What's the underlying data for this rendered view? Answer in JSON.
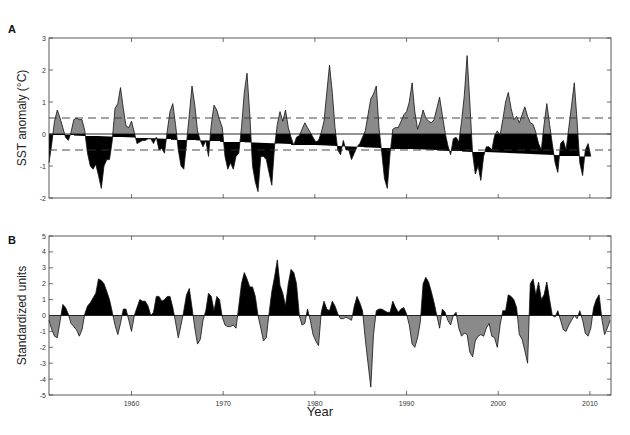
{
  "figure": {
    "panels": [
      "A",
      "B"
    ],
    "xlabel": "Year"
  },
  "colors": {
    "positive_top": "#8a8a8a",
    "negative_top": "#000000",
    "positive_bottom": "#000000",
    "negative_bottom": "#8a8a8a",
    "axis": "#333333",
    "dashed": "#333333"
  },
  "chart_data": [
    {
      "type": "area",
      "panel": "A",
      "title": "",
      "xlabel": "",
      "ylabel": "SST anomaly (°C)",
      "xlim": [
        1951,
        2012.3
      ],
      "ylim": [
        -2,
        3
      ],
      "yticks": [
        -2,
        -1,
        0,
        1,
        2,
        3
      ],
      "xticks": [
        1960,
        1970,
        1980,
        1990,
        2000,
        2010
      ],
      "xtick_labels_shown": false,
      "reference_lines": [
        {
          "y": 0.5,
          "style": "dashed"
        },
        {
          "y": -0.5,
          "style": "dashed"
        },
        {
          "y": 0,
          "style": "solid"
        }
      ],
      "fill_above_zero": "gray",
      "fill_below_zero": "black",
      "x": [
        1951.0,
        1951.3,
        1951.6,
        1951.9,
        1952.2,
        1952.5,
        1952.8,
        1953.1,
        1953.4,
        1953.7,
        1954.0,
        1954.3,
        1954.6,
        1954.9,
        1955.2,
        1955.5,
        1955.8,
        1956.1,
        1956.4,
        1956.7,
        1957.0,
        1957.3,
        1957.6,
        1957.9,
        1958.2,
        1958.5,
        1958.8,
        1959.1,
        1959.4,
        1959.7,
        1960.0,
        1960.3,
        1960.6,
        1960.9,
        1961.2,
        1961.5,
        1961.8,
        1962.1,
        1962.4,
        1962.7,
        1963.0,
        1963.3,
        1963.6,
        1963.9,
        1964.2,
        1964.5,
        1964.8,
        1965.1,
        1965.4,
        1965.7,
        1966.0,
        1966.3,
        1966.6,
        1966.9,
        1967.2,
        1967.5,
        1967.8,
        1968.1,
        1968.4,
        1968.7,
        1969.0,
        1969.3,
        1969.6,
        1969.9,
        1970.2,
        1970.5,
        1970.8,
        1971.1,
        1971.4,
        1971.7,
        1972.0,
        1972.3,
        1972.6,
        1972.9,
        1973.2,
        1973.5,
        1973.8,
        1974.1,
        1974.4,
        1974.7,
        1975.0,
        1975.3,
        1975.6,
        1975.9,
        1976.2,
        1976.5,
        1976.8,
        1977.1,
        1977.4,
        1977.7,
        1978.0,
        1978.3,
        1978.6,
        1978.9,
        1979.2,
        1979.5,
        1979.8,
        1980.1,
        1980.4,
        1980.7,
        1981.0,
        1981.3,
        1981.6,
        1981.9,
        1982.2,
        1982.5,
        1982.8,
        1983.1,
        1983.4,
        1983.7,
        1984.0,
        1984.3,
        1984.6,
        1984.9,
        1985.2,
        1985.5,
        1985.8,
        1986.1,
        1986.4,
        1986.7,
        1987.0,
        1987.3,
        1987.6,
        1987.9,
        1988.2,
        1988.5,
        1988.8,
        1989.1,
        1989.4,
        1989.7,
        1990.0,
        1990.3,
        1990.6,
        1990.9,
        1991.2,
        1991.5,
        1991.8,
        1992.1,
        1992.4,
        1992.7,
        1993.0,
        1993.3,
        1993.6,
        1993.9,
        1994.2,
        1994.5,
        1994.8,
        1995.1,
        1995.4,
        1995.7,
        1996.0,
        1996.3,
        1996.6,
        1996.9,
        1997.2,
        1997.5,
        1997.8,
        1998.1,
        1998.4,
        1998.7,
        1999.0,
        1999.3,
        1999.6,
        1999.9,
        2000.2,
        2000.5,
        2000.8,
        2001.1,
        2001.4,
        2001.7,
        2002.0,
        2002.3,
        2002.6,
        2002.9,
        2003.2,
        2003.5,
        2003.8,
        2004.1,
        2004.4,
        2004.7,
        2005.0,
        2005.3,
        2005.6,
        2005.9,
        2006.2,
        2006.5,
        2006.8,
        2007.1,
        2007.4,
        2007.7,
        2008.0,
        2008.3,
        2008.6,
        2008.9,
        2009.2,
        2009.5,
        2009.8,
        2010.1,
        2010.4,
        2010.7,
        2011.0,
        2011.3,
        2011.6,
        2011.9,
        2012.2
      ],
      "values": [
        -0.9,
        -0.3,
        0.4,
        0.75,
        0.5,
        0.2,
        -0.1,
        -0.2,
        0.05,
        0.45,
        0.5,
        0.45,
        0.45,
        0.1,
        -0.6,
        -1.0,
        -1.1,
        -0.95,
        -1.3,
        -1.7,
        -1.0,
        -0.8,
        -0.8,
        -0.2,
        0.8,
        0.95,
        1.45,
        0.8,
        0.25,
        0.2,
        0.4,
        0.05,
        -0.3,
        -0.25,
        -0.2,
        -0.2,
        -0.15,
        -0.15,
        -0.3,
        -0.1,
        -0.5,
        -0.45,
        -0.6,
        0.1,
        0.7,
        0.95,
        0.3,
        -0.5,
        -1.0,
        -1.1,
        -0.3,
        0.6,
        1.5,
        0.9,
        0.1,
        -0.2,
        -0.4,
        -0.2,
        -0.7,
        0.3,
        0.9,
        0.75,
        0.45,
        0.2,
        -0.7,
        -1.1,
        -0.9,
        -1.1,
        -0.7,
        -0.6,
        0.2,
        1.3,
        1.9,
        0.6,
        -1.0,
        -1.5,
        -1.8,
        -0.7,
        -0.7,
        -0.8,
        -1.2,
        -1.6,
        -0.4,
        0.3,
        0.7,
        0.4,
        0.75,
        0.2,
        -0.1,
        -0.35,
        -0.1,
        -0.05,
        0.15,
        0.35,
        0.2,
        0.05,
        -0.1,
        -0.25,
        -0.2,
        0.05,
        0.4,
        1.3,
        2.15,
        1.3,
        0.2,
        -0.5,
        -0.65,
        -0.2,
        -0.5,
        -0.5,
        -0.8,
        -0.6,
        -0.4,
        -0.3,
        -0.1,
        0.1,
        0.6,
        1.1,
        1.25,
        1.5,
        0.2,
        -0.6,
        -1.4,
        -1.7,
        -0.6,
        0.15,
        0.2,
        0.2,
        0.4,
        0.6,
        0.7,
        1.0,
        1.6,
        0.7,
        0.15,
        0.4,
        0.75,
        0.5,
        0.4,
        0.35,
        0.45,
        0.8,
        1.15,
        0.6,
        0.05,
        -0.35,
        -0.65,
        -0.15,
        -0.1,
        -0.25,
        0.4,
        1.2,
        2.45,
        1.0,
        -0.6,
        -1.25,
        -1.0,
        -1.45,
        -0.7,
        -0.4,
        -0.4,
        -0.5,
        -0.05,
        0.1,
        -0.05,
        0.45,
        1.0,
        1.3,
        0.8,
        0.45,
        0.55,
        0.35,
        0.6,
        0.85,
        0.55,
        0.35,
        0.3,
        0.05,
        -0.3,
        -0.5,
        0.3,
        0.95,
        0.3,
        -0.3,
        -0.9,
        -1.2,
        -0.3,
        -0.2,
        -0.5,
        0.2,
        0.9,
        1.6,
        0.4,
        -0.9,
        -1.3,
        -0.5,
        -0.3,
        -0.7
      ]
    },
    {
      "type": "area",
      "panel": "B",
      "title": "",
      "xlabel": "Year",
      "ylabel": "Standardized units",
      "xlim": [
        1951,
        2012.3
      ],
      "ylim": [
        -5,
        5
      ],
      "yticks": [
        -5,
        -4,
        -3,
        -2,
        -1,
        0,
        1,
        2,
        3,
        4,
        5
      ],
      "xticks": [
        1960,
        1970,
        1980,
        1990,
        2000,
        2010
      ],
      "xtick_labels": [
        "1960",
        "1970",
        "1980",
        "1990",
        "2000",
        "2010"
      ],
      "reference_lines": [
        {
          "y": 0,
          "style": "solid"
        }
      ],
      "fill_above_zero": "black",
      "fill_below_zero": "gray",
      "x": [
        1951.0,
        1951.3,
        1951.6,
        1951.9,
        1952.2,
        1952.5,
        1952.8,
        1953.1,
        1953.4,
        1953.7,
        1954.0,
        1954.3,
        1954.6,
        1954.9,
        1955.2,
        1955.5,
        1955.8,
        1956.1,
        1956.4,
        1956.7,
        1957.0,
        1957.3,
        1957.6,
        1957.9,
        1958.2,
        1958.5,
        1958.8,
        1959.1,
        1959.4,
        1959.7,
        1960.0,
        1960.3,
        1960.6,
        1960.9,
        1961.2,
        1961.5,
        1961.8,
        1962.1,
        1962.4,
        1962.7,
        1963.0,
        1963.3,
        1963.6,
        1963.9,
        1964.2,
        1964.5,
        1964.8,
        1965.1,
        1965.4,
        1965.7,
        1966.0,
        1966.3,
        1966.6,
        1966.9,
        1967.2,
        1967.5,
        1967.8,
        1968.1,
        1968.4,
        1968.7,
        1969.0,
        1969.3,
        1969.6,
        1969.9,
        1970.2,
        1970.5,
        1970.8,
        1971.1,
        1971.4,
        1971.7,
        1972.0,
        1972.3,
        1972.6,
        1972.9,
        1973.2,
        1973.5,
        1973.8,
        1974.1,
        1974.4,
        1974.7,
        1975.0,
        1975.3,
        1975.6,
        1975.9,
        1976.2,
        1976.5,
        1976.8,
        1977.1,
        1977.4,
        1977.7,
        1978.0,
        1978.3,
        1978.6,
        1978.9,
        1979.2,
        1979.5,
        1979.8,
        1980.1,
        1980.4,
        1980.7,
        1981.0,
        1981.3,
        1981.6,
        1981.9,
        1982.2,
        1982.5,
        1982.8,
        1983.1,
        1983.4,
        1983.7,
        1984.0,
        1984.3,
        1984.6,
        1984.9,
        1985.2,
        1985.5,
        1985.8,
        1986.1,
        1986.4,
        1986.7,
        1987.0,
        1987.3,
        1987.6,
        1987.9,
        1988.2,
        1988.5,
        1988.8,
        1989.1,
        1989.4,
        1989.7,
        1990.0,
        1990.3,
        1990.6,
        1990.9,
        1991.2,
        1991.5,
        1991.8,
        1992.1,
        1992.4,
        1992.7,
        1993.0,
        1993.3,
        1993.6,
        1993.9,
        1994.2,
        1994.5,
        1994.8,
        1995.1,
        1995.4,
        1995.7,
        1996.0,
        1996.3,
        1996.6,
        1996.9,
        1997.2,
        1997.5,
        1997.8,
        1998.1,
        1998.4,
        1998.7,
        1999.0,
        1999.3,
        1999.6,
        1999.9,
        2000.2,
        2000.5,
        2000.8,
        2001.1,
        2001.4,
        2001.7,
        2002.0,
        2002.3,
        2002.6,
        2002.9,
        2003.2,
        2003.5,
        2003.8,
        2004.1,
        2004.4,
        2004.7,
        2005.0,
        2005.3,
        2005.6,
        2005.9,
        2006.2,
        2006.5,
        2006.8,
        2007.1,
        2007.4,
        2007.7,
        2008.0,
        2008.3,
        2008.6,
        2008.9,
        2009.2,
        2009.5,
        2009.8,
        2010.1,
        2010.4,
        2010.7,
        2011.0,
        2011.3,
        2011.6,
        2011.9,
        2012.2
      ],
      "values": [
        -0.3,
        -0.9,
        -1.3,
        -1.4,
        -0.4,
        0.7,
        0.5,
        0.1,
        -0.5,
        -0.7,
        -0.9,
        -1.3,
        -0.9,
        0.1,
        0.6,
        0.8,
        1.1,
        1.4,
        2.3,
        2.2,
        2.0,
        1.5,
        1.0,
        0.2,
        -0.6,
        -1.2,
        -0.5,
        0.4,
        0.4,
        -0.3,
        -1.0,
        0.0,
        0.5,
        1.0,
        0.9,
        0.9,
        0.6,
        0.0,
        0.2,
        1.2,
        1.2,
        0.9,
        1.0,
        1.2,
        1.2,
        0.5,
        -0.4,
        -1.4,
        -0.6,
        0.3,
        1.3,
        1.7,
        0.5,
        -0.8,
        -1.8,
        -1.5,
        -0.3,
        0.3,
        1.4,
        1.2,
        0.3,
        1.2,
        1.0,
        -0.1,
        -0.6,
        -0.7,
        -0.7,
        -0.6,
        -0.8,
        0.6,
        2.0,
        2.7,
        2.3,
        1.8,
        1.8,
        1.2,
        0.0,
        -0.8,
        -1.6,
        -1.4,
        0.1,
        1.5,
        2.4,
        3.5,
        1.9,
        1.4,
        0.6,
        2.0,
        2.9,
        2.7,
        2.0,
        0.0,
        -0.6,
        -0.5,
        0.4,
        -0.3,
        -1.2,
        -1.6,
        -1.9,
        0.2,
        0.9,
        0.4,
        0.3,
        0.9,
        0.6,
        0.1,
        -0.2,
        -0.2,
        -0.1,
        -0.2,
        -0.3,
        0.6,
        1.2,
        0.8,
        0.3,
        -1.5,
        -3.0,
        -4.5,
        -1.2,
        0.3,
        0.4,
        0.4,
        0.3,
        0.2,
        0.2,
        0.9,
        0.5,
        0.2,
        0.4,
        0.5,
        0.1,
        -0.6,
        -1.8,
        -2.0,
        -1.4,
        -0.4,
        2.0,
        2.4,
        2.1,
        1.5,
        0.8,
        0.0,
        -0.8,
        0.4,
        0.2,
        -0.3,
        -0.6,
        0.0,
        0.2,
        -0.8,
        -1.3,
        -1.1,
        -1.2,
        -2.3,
        -2.6,
        -1.6,
        -1.3,
        -1.2,
        -1.3,
        -0.8,
        -0.5,
        -1.3,
        -1.4,
        -2.0,
        -0.6,
        0.3,
        0.3,
        1.3,
        1.2,
        1.0,
        0.5,
        -1.2,
        -1.5,
        -2.2,
        -3.0,
        2.0,
        2.3,
        1.3,
        2.1,
        1.0,
        1.3,
        2.1,
        1.0,
        0.0,
        -0.1,
        0.3,
        -0.3,
        -0.9,
        -1.0,
        -0.6,
        -0.3,
        0.0,
        -0.2,
        0.3,
        -0.3,
        -1.1,
        -1.3,
        -0.8,
        0.5,
        1.0,
        1.3,
        -0.2,
        -1.2,
        -0.8,
        -0.3,
        0.2,
        1.2,
        2.8,
        2.2,
        1.8,
        2.2,
        0.9,
        0.0,
        -0.5,
        -1.5,
        1.5,
        3.2,
        4.0,
        1.3,
        2.1
      ]
    }
  ]
}
